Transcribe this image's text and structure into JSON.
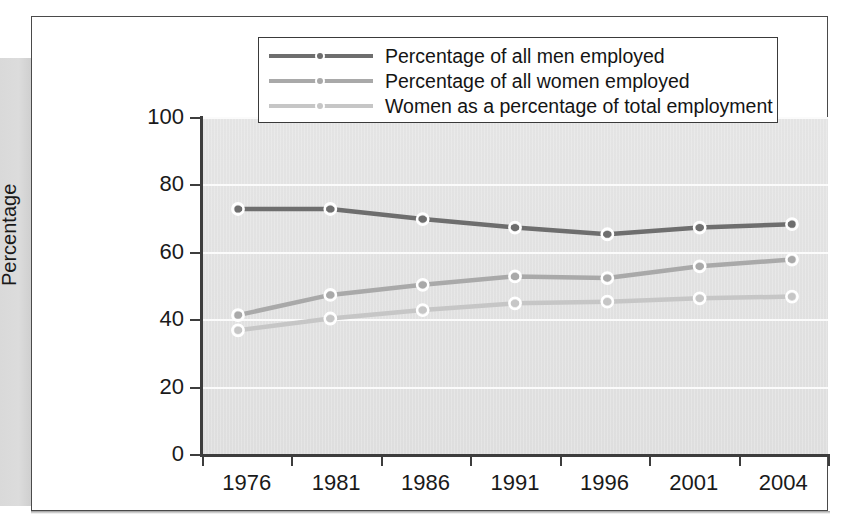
{
  "chart_data": {
    "type": "line",
    "title": "",
    "xlabel": "",
    "ylabel": "Percentage",
    "categories": [
      "1976",
      "1981",
      "1986",
      "1991",
      "1996",
      "2001",
      "2004"
    ],
    "ylim": [
      0,
      100
    ],
    "yticks": [
      "0",
      "20",
      "40",
      "60",
      "80",
      "100"
    ],
    "ytick_values": [
      0,
      20,
      40,
      60,
      80,
      100
    ],
    "grid": "horizontal-white-gridlines",
    "legend_position": "top-center-overlapping-plot",
    "series": [
      {
        "name": "Percentage of all men employed",
        "color": "#6e6e6e",
        "values": [
          73,
          73,
          70,
          67.5,
          65.5,
          67.5,
          68.5
        ]
      },
      {
        "name": "Percentage of all women employed",
        "color": "#a9a9a9",
        "values": [
          41.5,
          47.5,
          50.5,
          53,
          52.5,
          56,
          58
        ]
      },
      {
        "name": "Women as a percentage of total employment",
        "color": "#c6c6c6",
        "values": [
          37,
          40.5,
          43,
          45,
          45.5,
          46.5,
          47
        ]
      }
    ]
  },
  "axis": {
    "y_title": "Percentage"
  },
  "colors": {
    "plot_background": "#e2e2e2",
    "gridline": "#fbfbfb",
    "axis": "#3d3d3d",
    "frame": "#4a4a4a",
    "series_men": "#6e6e6e",
    "series_women": "#a9a9a9",
    "series_share": "#c6c6c6",
    "marker_ring": "#ffffff"
  }
}
